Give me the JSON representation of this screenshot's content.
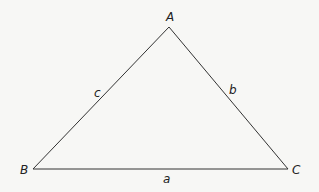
{
  "diagram": {
    "colors": {
      "background": "#f7f7f5",
      "stroke": "#333333",
      "text": "#222222"
    },
    "vertices": [
      {
        "label": "A",
        "x": 169,
        "y": 27,
        "label_x": 166,
        "label_y": 21
      },
      {
        "label": "B",
        "x": 33,
        "y": 169,
        "label_x": 20,
        "label_y": 174
      },
      {
        "label": "C",
        "x": 288,
        "y": 169,
        "label_x": 292,
        "label_y": 174
      }
    ],
    "sides": [
      {
        "label": "a",
        "from": "B",
        "to": "C",
        "label_x": 163,
        "label_y": 183
      },
      {
        "label": "b",
        "from": "C",
        "to": "A",
        "label_x": 229,
        "label_y": 94
      },
      {
        "label": "c",
        "from": "A",
        "to": "B",
        "label_x": 94,
        "label_y": 97
      }
    ]
  }
}
